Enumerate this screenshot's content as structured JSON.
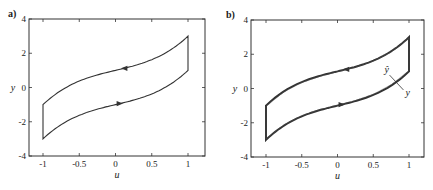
{
  "chart_data": [
    {
      "type": "line",
      "panel_label": "a)",
      "title": "",
      "xlabel": "u",
      "ylabel": "y",
      "xlim": [
        -1.2,
        1.2
      ],
      "ylim": [
        -4,
        4
      ],
      "xticks": [
        -1,
        -0.5,
        0,
        0.5,
        1
      ],
      "xtick_labels": [
        "-1",
        "-0.5",
        "0",
        "0.5",
        "1"
      ],
      "yticks": [
        -4,
        -2,
        0,
        2,
        4
      ],
      "ytick_labels": [
        "-4",
        "-2",
        "0",
        "2",
        "4"
      ],
      "grid": false,
      "description": "Hysteresis loop: upper branch y = u^3 + u + 1 traversed right-to-left, lower branch y = u^3 + u - 1 traversed left-to-right, vertical jumps at u = -1 and u = 1",
      "series": [
        {
          "name": "upper branch (decreasing u)",
          "x": [
            1,
            0.75,
            0.5,
            0.25,
            0,
            -0.25,
            -0.5,
            -0.75,
            -1
          ],
          "y": [
            3.0,
            2.17,
            1.63,
            1.27,
            1.0,
            0.73,
            0.38,
            -0.17,
            -1.0
          ],
          "arrow_at": [
            0.1,
            1.1
          ],
          "arrow_direction": "left"
        },
        {
          "name": "lower branch (increasing u)",
          "x": [
            -1,
            -0.75,
            -0.5,
            -0.25,
            0,
            0.25,
            0.5,
            0.75,
            1
          ],
          "y": [
            -3.0,
            -2.17,
            -1.63,
            -1.27,
            -1.0,
            -0.73,
            -0.38,
            0.17,
            1.0
          ],
          "arrow_at": [
            0.05,
            -0.95
          ],
          "arrow_direction": "right"
        },
        {
          "name": "jump at u=1",
          "x": [
            1,
            1
          ],
          "y": [
            1.0,
            3.0
          ]
        },
        {
          "name": "jump at u=-1",
          "x": [
            -1,
            -1
          ],
          "y": [
            -1.0,
            -3.0
          ]
        }
      ]
    },
    {
      "type": "line",
      "panel_label": "b)",
      "title": "",
      "xlabel": "u",
      "ylabel": "y",
      "xlim": [
        -1.2,
        1.2
      ],
      "ylim": [
        -4,
        4
      ],
      "xticks": [
        -1,
        -0.5,
        0,
        0.5,
        1
      ],
      "xtick_labels": [
        "-1",
        "-0.5",
        "0",
        "0.5",
        "1"
      ],
      "yticks": [
        -4,
        -2,
        0,
        2,
        4
      ],
      "ytick_labels": [
        "-4",
        "-2",
        "0",
        "2",
        "4"
      ],
      "grid": false,
      "annotations": [
        {
          "text": "ŷ",
          "x": 0.7,
          "y": 0.9
        },
        {
          "text": "y",
          "x": 0.95,
          "y": -0.2
        }
      ],
      "description": "Same hysteresis loop with model output ŷ overlaid nearly coincident with measured y (thicker combined curve)",
      "series": [
        {
          "name": "y (measured)",
          "x": [
            -1,
            -0.75,
            -0.5,
            -0.25,
            0,
            0.25,
            0.5,
            0.75,
            1,
            1,
            0.75,
            0.5,
            0.25,
            0,
            -0.25,
            -0.5,
            -0.75,
            -1,
            -1
          ],
          "y": [
            -3.0,
            -2.17,
            -1.63,
            -1.27,
            -1.0,
            -0.73,
            -0.38,
            0.17,
            1.0,
            3.0,
            2.17,
            1.63,
            1.27,
            1.0,
            0.73,
            0.38,
            -0.17,
            -1.0,
            -3.0
          ]
        },
        {
          "name": "ŷ (model)",
          "x": [
            -1,
            -0.75,
            -0.5,
            -0.25,
            0,
            0.25,
            0.5,
            0.75,
            1,
            1,
            0.75,
            0.5,
            0.25,
            0,
            -0.25,
            -0.5,
            -0.75,
            -1,
            -1
          ],
          "y": [
            -2.95,
            -2.12,
            -1.58,
            -1.23,
            -0.97,
            -0.7,
            -0.33,
            0.22,
            1.05,
            2.95,
            2.12,
            1.6,
            1.24,
            0.98,
            0.7,
            0.35,
            -0.2,
            -1.05,
            -2.95
          ]
        }
      ]
    }
  ],
  "labels": {
    "panel_a": "a)",
    "panel_b": "b)",
    "xlabel": "u",
    "ylabel": "y",
    "yhat_label": "ŷ",
    "y_label_annot": "y"
  }
}
